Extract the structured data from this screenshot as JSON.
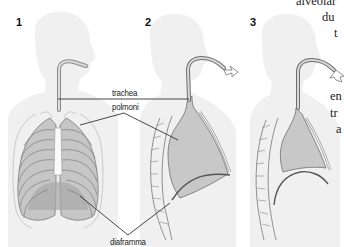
{
  "diagram": {
    "panels": [
      {
        "number": "1",
        "view": "front view of thorax with lungs and rib cage"
      },
      {
        "number": "2",
        "view": "side section, inhalation (arrow in)"
      },
      {
        "number": "3",
        "view": "side section, exhalation (arrow out)"
      }
    ],
    "labels": {
      "trachea": "trachea",
      "lungs": "polmoni",
      "diaphragm": "diaframma"
    },
    "colors": {
      "silhouette": "#efefef",
      "lung_fill": "#c8c8c8",
      "outline": "#6e6e6e",
      "leader_line": "#333333"
    }
  },
  "side_text": {
    "lines": [
      "alveolar",
      "du",
      "t",
      "en",
      "tr",
      "a"
    ]
  }
}
